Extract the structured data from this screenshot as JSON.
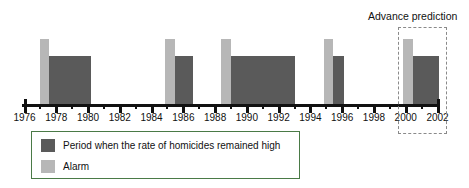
{
  "chart_data": {
    "type": "bar",
    "title": "",
    "xlabel": "",
    "ylabel": "",
    "xlim": [
      1976,
      2002.6
    ],
    "grid": false,
    "legend_position": "below-axis-left",
    "tick_labels": [
      "1976",
      "1978",
      "1980",
      "1982",
      "1984",
      "1986",
      "1988",
      "1990",
      "1992",
      "1994",
      "1996",
      "1998",
      "2000",
      "2002"
    ],
    "tick_values": [
      1976,
      1978,
      1980,
      1982,
      1984,
      1986,
      1988,
      1990,
      1992,
      1994,
      1996,
      1998,
      2000,
      2002
    ],
    "minor_tick_values": [
      1977,
      1979,
      1981,
      1983,
      1985,
      1987,
      1989,
      1991,
      1993,
      1995,
      1997,
      1999,
      2001
    ],
    "series": [
      {
        "name": "Period when the rate of homicides remained high",
        "color": "#5a5a5a",
        "type": "interval",
        "height": 1.0,
        "intervals": [
          {
            "start": 1977.1,
            "end": 1980.2
          },
          {
            "start": 1985.0,
            "end": 1986.6
          },
          {
            "start": 1988.6,
            "end": 1993.0
          },
          {
            "start": 1995.0,
            "end": 1996.1
          },
          {
            "start": 2000.0,
            "end": 2002.1
          }
        ]
      },
      {
        "name": "Alarm",
        "color": "#b7b7b7",
        "type": "interval",
        "height": 1.35,
        "intervals": [
          {
            "start": 1976.95,
            "end": 1977.55
          },
          {
            "start": 1984.85,
            "end": 1985.45
          },
          {
            "start": 1988.4,
            "end": 1989.0
          },
          {
            "start": 1994.85,
            "end": 1995.45
          },
          {
            "start": 1999.85,
            "end": 2000.45
          }
        ]
      }
    ],
    "annotations": [
      {
        "name": "advance-prediction",
        "text": "Advance prediction",
        "box_start": 1999.5,
        "box_end": 2002.6,
        "style": "dashed"
      }
    ]
  },
  "legend": {
    "items": [
      {
        "label": "Period when the rate of homicides remained high",
        "color": "#5a5a5a"
      },
      {
        "label": "Alarm",
        "color": "#b7b7b7"
      }
    ]
  },
  "annotation": {
    "advance_prediction_label": "Advance prediction"
  },
  "colors": {
    "period": "#5a5a5a",
    "alarm": "#b7b7b7",
    "axis": "#111111",
    "legend_border": "#4a7a46",
    "prediction_border": "#8a8a8a",
    "background": "#ffffff"
  }
}
